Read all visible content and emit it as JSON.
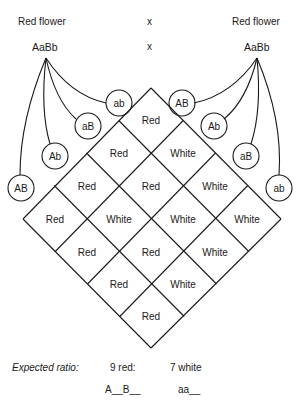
{
  "parents": {
    "left": {
      "phenotype": "Red flower",
      "genotype": "AaBb"
    },
    "cross_symbol": "x",
    "right": {
      "phenotype": "Red flower",
      "genotype": "AaBb"
    }
  },
  "gametes": {
    "left": [
      "ab",
      "aB",
      "Ab",
      "AB"
    ],
    "right": [
      "AB",
      "Ab",
      "aB",
      "ab"
    ]
  },
  "grid": {
    "rows_note": "row index = left gamete (ab, aB, Ab, AB); col index = right gamete (AB, Ab, aB, ab)",
    "cells": [
      [
        "Red",
        "White",
        "Red",
        "White"
      ],
      [
        "Red",
        "Red",
        "White",
        "White"
      ],
      [
        "Red",
        "White",
        "Red",
        "White"
      ],
      [
        "Red",
        "Red",
        "Red",
        "Red"
      ]
    ],
    "cells_by_row_top_to_bottom": [
      [
        "Red"
      ],
      [
        "Red",
        "White"
      ],
      [
        "Red",
        "Red",
        "White"
      ],
      [
        "Red",
        "White",
        "White",
        "White"
      ],
      [
        "Red",
        "Red",
        "White"
      ],
      [
        "Red",
        "White"
      ],
      [
        "Red"
      ]
    ]
  },
  "ratio": {
    "label": "Expected ratio:",
    "red": "9 red:",
    "white": "7 white",
    "red_genotype": "A__B__",
    "white_genotype": "aa__"
  },
  "colors": {
    "line": "#1a1a1a",
    "background": "#ffffff"
  }
}
